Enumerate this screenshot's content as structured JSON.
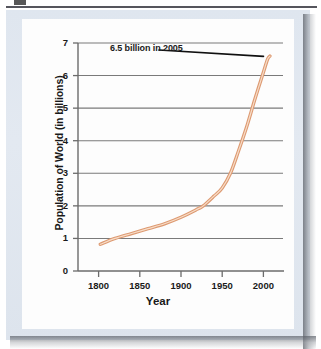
{
  "figure": {
    "background_color": "#e1e8f0",
    "card_color": "#fdfdfd",
    "curve_color": "#e0a07a",
    "curve_highlight_color": "#f7d9c2",
    "axis_color": "#6b6b6b",
    "grid_color": "#7a7a7a",
    "text_color": "#1a1a1a"
  },
  "chart_data": {
    "type": "line",
    "title": "",
    "xlabel": "Year",
    "ylabel": "Population of World (in billions)",
    "xlim": [
      1775,
      2025
    ],
    "ylim": [
      0,
      7
    ],
    "xticks": [
      1800,
      1850,
      1900,
      1950,
      2000
    ],
    "xtick_labels": [
      "1800",
      "1850",
      "1900",
      "1950",
      "2000"
    ],
    "yticks": [
      0,
      1,
      2,
      3,
      4,
      5,
      6,
      7
    ],
    "ytick_labels": [
      "0",
      "1",
      "2",
      "3",
      "4",
      "5",
      "6",
      "7"
    ],
    "grid": "horizontal",
    "legend": "none",
    "annotations": [
      {
        "text": "6.5 billion in 2005",
        "points_to_x": 2005,
        "points_to_y": 6.5,
        "leader_line": true
      }
    ],
    "series": [
      {
        "name": "World population",
        "x": [
          1802,
          1820,
          1840,
          1860,
          1880,
          1900,
          1920,
          1927,
          1940,
          1950,
          1960,
          1970,
          1980,
          1990,
          2000,
          2005,
          2008
        ],
        "values": [
          0.82,
          1.0,
          1.15,
          1.3,
          1.45,
          1.65,
          1.9,
          2.0,
          2.3,
          2.55,
          3.0,
          3.7,
          4.45,
          5.3,
          6.1,
          6.5,
          6.6
        ]
      }
    ]
  }
}
